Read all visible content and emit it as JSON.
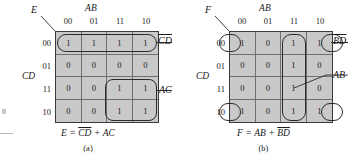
{
  "figures": [
    {
      "id": "a",
      "output_var": "E",
      "top_var": "AB",
      "side_var": "CD",
      "col_labels": [
        "00",
        "01",
        "11",
        "10"
      ],
      "row_labels": [
        "00",
        "01",
        "11",
        "10"
      ],
      "cells": [
        [
          "1",
          "1",
          "1",
          "1"
        ],
        [
          "0",
          "0",
          "0",
          "0"
        ],
        [
          "0",
          "0",
          "1",
          "1"
        ],
        [
          "0",
          "0",
          "1",
          "1"
        ]
      ],
      "group_labels": [
        {
          "name": "group-label-cd-bar",
          "text": "CD",
          "overbar": true
        },
        {
          "name": "group-label-ac",
          "text": "AC",
          "overbar": false
        }
      ],
      "equation": {
        "lhs": "E",
        "eq": "=",
        "term1": "CD",
        "term1_overbar": true,
        "plus": "+",
        "term2": "AC",
        "term2_overbar": false
      },
      "caption": "(a)"
    },
    {
      "id": "b",
      "output_var": "F",
      "top_var": "AB",
      "side_var": "CD",
      "col_labels": [
        "00",
        "01",
        "11",
        "10"
      ],
      "row_labels": [
        "00",
        "01",
        "11",
        "10"
      ],
      "cells": [
        [
          "1",
          "0",
          "1",
          "1"
        ],
        [
          "0",
          "0",
          "1",
          "0"
        ],
        [
          "0",
          "0",
          "1",
          "0"
        ],
        [
          "1",
          "0",
          "1",
          "1"
        ]
      ],
      "group_labels": [
        {
          "name": "group-label-bd-bar",
          "text": "BD",
          "overbar": true
        },
        {
          "name": "group-label-ab",
          "text": "AB",
          "overbar": false
        }
      ],
      "equation": {
        "lhs": "F",
        "eq": "=",
        "term1": "AB",
        "term1_overbar": false,
        "plus": "+",
        "term2": "BD",
        "term2_overbar": true
      },
      "caption": "(b)"
    }
  ],
  "colors": {
    "cell_fill": "#c9c9c9",
    "grid_line": "#6f6f6f",
    "border": "#3a3a3a",
    "ink": "#1a1a1a"
  }
}
